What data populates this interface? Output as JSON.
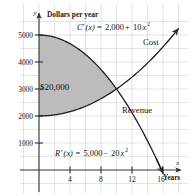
{
  "chart_data": {
    "type": "line",
    "title": "",
    "xlabel": "Years",
    "ylabel": "Dollars per year",
    "x_axis_symbol": "x",
    "y_axis_symbol": "y",
    "xlim": [
      -2,
      19
    ],
    "ylim": [
      -800,
      5600
    ],
    "xticks": [
      4,
      8,
      12,
      16
    ],
    "xtick_labels": [
      "4",
      "8",
      "12",
      "16"
    ],
    "yticks": [
      1000,
      2000,
      3000,
      4000,
      5000
    ],
    "ytick_labels": [
      "1000",
      "2000",
      "3000",
      "4000",
      "5000"
    ],
    "grid": true,
    "grid_x_step": 2,
    "grid_y_step": 500,
    "grid_color": "#d0d0d0",
    "axis_color": "#3a3a3a",
    "curve_color": "#1a1a1a",
    "shade_color": "#b8b8b8",
    "legend_position": "inline-annotations",
    "series": [
      {
        "name": "Cost",
        "label": "Cost",
        "equation": "C'(x) = 2,000 + 10x²",
        "equation_parts": {
          "function": "C′(x)",
          "equals": "=",
          "constant": "2,000",
          "operator": "+",
          "coefficient": "10",
          "variable": "x",
          "exponent": "2"
        },
        "formula_type": "quadratic",
        "a": 10,
        "b": 0,
        "c": 2000,
        "x_start": 0,
        "x_end": 18,
        "arrow_end": true,
        "points": [
          {
            "x": 0,
            "y": 2000
          },
          {
            "x": 2,
            "y": 2040
          },
          {
            "x": 4,
            "y": 2160
          },
          {
            "x": 6,
            "y": 2360
          },
          {
            "x": 8,
            "y": 2640
          },
          {
            "x": 10,
            "y": 3000
          },
          {
            "x": 12,
            "y": 3440
          },
          {
            "x": 14,
            "y": 3960
          },
          {
            "x": 16,
            "y": 4560
          },
          {
            "x": 18,
            "y": 5240
          }
        ]
      },
      {
        "name": "Revenue",
        "label": "Revenue",
        "equation": "R'(x) = 5,000 − 20x²",
        "equation_parts": {
          "function": "R′(x)",
          "equals": "=",
          "constant": "5,000",
          "operator": "−",
          "coefficient": "20",
          "variable": "x",
          "exponent": "2"
        },
        "formula_type": "quadratic",
        "a": -20,
        "b": 0,
        "c": 5000,
        "x_start": 0,
        "x_end": 16,
        "arrow_end": true,
        "points": [
          {
            "x": 0,
            "y": 5000
          },
          {
            "x": 2,
            "y": 4920
          },
          {
            "x": 4,
            "y": 4680
          },
          {
            "x": 6,
            "y": 4280
          },
          {
            "x": 8,
            "y": 3720
          },
          {
            "x": 10,
            "y": 3000
          },
          {
            "x": 12,
            "y": 2120
          },
          {
            "x": 14,
            "y": 1080
          },
          {
            "x": 16,
            "y": 0
          }
        ]
      }
    ],
    "intersection": {
      "x": 10,
      "y": 3000
    },
    "shaded_region": {
      "label": "$20,000",
      "x_from": 0,
      "x_to": 10,
      "between": [
        "Revenue",
        "Cost"
      ],
      "area_value": 20000
    },
    "annotations": [
      {
        "id": "cost-equation",
        "text": "C'(x) = 2,000 + 10x²"
      },
      {
        "id": "revenue-equation",
        "text": "R'(x) = 5,000 − 20x²"
      },
      {
        "id": "cost-label",
        "text": "Cost"
      },
      {
        "id": "revenue-label",
        "text": "Revenue"
      },
      {
        "id": "area-label",
        "text": "$20,000"
      },
      {
        "id": "y-axis-caption",
        "text": "Dollars per year"
      },
      {
        "id": "x-axis-caption",
        "text": "Years"
      }
    ]
  },
  "labels": {
    "y_axis_caption": "Dollars per year",
    "x_axis_caption": "Years",
    "x_symbol": "x",
    "y_symbol": "y",
    "area": "$20,000",
    "cost": "Cost",
    "revenue": "Revenue",
    "ytick_5000": "5000",
    "ytick_4000": "4000",
    "ytick_3000": "3000",
    "ytick_2000": "2000",
    "ytick_1000": "1000",
    "xtick_4": "4",
    "xtick_8": "8",
    "xtick_12": "12",
    "xtick_16": "16"
  },
  "equations": {
    "cost": {
      "fn": "C",
      "prime": "′",
      "arg": "(x)",
      "eq": "=",
      "const": "2,000",
      "op": "+",
      "coef": "10",
      "var": "x",
      "exp": "2"
    },
    "revenue": {
      "fn": "R",
      "prime": "′",
      "arg": "(x)",
      "eq": "=",
      "const": "5,000",
      "op": "−",
      "coef": "20",
      "var": "x",
      "exp": "2"
    }
  }
}
